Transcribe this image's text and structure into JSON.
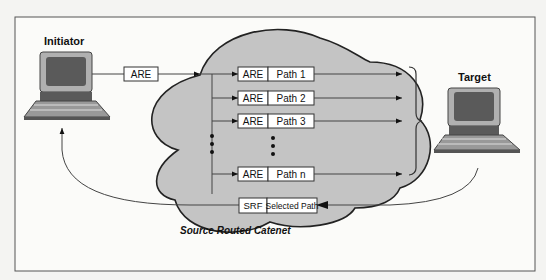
{
  "initiator": {
    "label": "Initiator"
  },
  "target": {
    "label": "Target"
  },
  "outgoing_frame": {
    "label": "ARE"
  },
  "cloud": {
    "label": "Source Routed Catenet"
  },
  "paths": [
    {
      "frame": "ARE",
      "path": "Path 1"
    },
    {
      "frame": "ARE",
      "path": "Path 2"
    },
    {
      "frame": "ARE",
      "path": "Path 3"
    },
    {
      "frame": "ARE",
      "path": "Path n"
    }
  ],
  "return_frame": {
    "frame": "SRF",
    "path": "Selected Path"
  },
  "colors": {
    "cloud": "#c4c4c4",
    "screen": "#5a5a5a",
    "monitor": "#a8a8a8",
    "keyboard": "#888888",
    "line": "#444444"
  }
}
